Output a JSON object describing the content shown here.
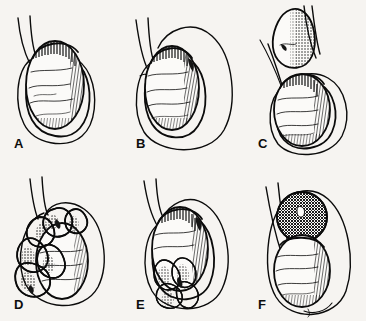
{
  "figure": {
    "type": "medical-line-illustration",
    "technique": "pen-and-ink hatching and stippling",
    "background_color": "#f6f4f1",
    "ink_color": "#0b0b0b",
    "rows": 2,
    "columns": 3,
    "total_panels": 6
  },
  "panels": [
    {
      "id": "a",
      "label": "A",
      "subject": "normal testis within tunica vaginalis",
      "features": "ovoid testis with hatched right margin, wavy surface creases, thin outer scrotal sac outline, two spermatic cord lines descending from upper left",
      "mass_present": false
    },
    {
      "id": "b",
      "label": "B",
      "subject": "hydrocele",
      "features": "testis displaced to the left within a markedly enlarged fluid-filled sac that balloons out to the right",
      "mass_present": true
    },
    {
      "id": "c",
      "label": "C",
      "subject": "spermatocele",
      "features": "separate pear-shaped cyst above and apart from the testis, densely stippled on its right flank, testis below in its own sac",
      "mass_present": true
    },
    {
      "id": "d",
      "label": "D",
      "subject": "varicocele",
      "features": "lobulated bag-of-worms dilated veins draped over and around the testis, heavy stipple shading between lobules",
      "mass_present": true
    },
    {
      "id": "e",
      "label": "E",
      "subject": "tumor at lower pole",
      "features": "irregular multinodular mass arising from the inferior pole of the testis, distorting the lower contour of the sac",
      "mass_present": true
    },
    {
      "id": "f",
      "label": "F",
      "subject": "mass at upper pole",
      "features": "rounded densely cross-hatched dark mass capping the superior pole of the testis with a bright highlight slit",
      "mass_present": true
    }
  ],
  "labels": {
    "a": "A",
    "b": "B",
    "c": "C",
    "d": "D",
    "e": "E",
    "f": "F"
  }
}
